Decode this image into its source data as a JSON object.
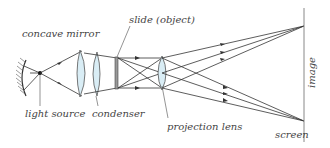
{
  "diagram": {
    "type": "optical projector ray diagram",
    "labels": {
      "concave_mirror": "concave mirror",
      "light_source": "light source",
      "condenser": "condenser",
      "slide": "slide (object)",
      "projection_lens": "projection lens",
      "image": "image",
      "screen": "screen"
    },
    "colors": {
      "line": "#333333",
      "lens_fill": "#d9edf5",
      "label": "#444444",
      "screen": "#888888"
    }
  }
}
